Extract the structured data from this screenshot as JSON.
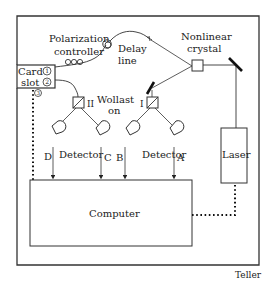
{
  "diagram": {
    "title": "",
    "labels": {
      "card_slot_line1": "Card",
      "card_slot_line2": "slot",
      "port1": "1",
      "port2": "2",
      "port3": "3",
      "polarization_line1": "Polarization",
      "polarization_line2": "controller",
      "delay_line1": "Delay",
      "delay_line2": "line",
      "nonlinear_line1": "Nonlinear",
      "nonlinear_line2": "crystal",
      "wollaston_line1": "Wollast",
      "wollaston_line2": "on",
      "wollaston_I": "I",
      "wollaston_II": "II",
      "detector_left": "Detector",
      "detector_right": "Detector",
      "det_A": "A",
      "det_B": "B",
      "det_C": "C",
      "det_D": "D",
      "laser": "Laser",
      "computer": "Computer",
      "credit": "Teller"
    },
    "colors": {
      "stroke": "#333333",
      "background": "#ffffff"
    }
  }
}
